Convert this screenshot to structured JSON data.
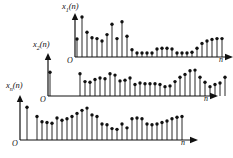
{
  "figure": {
    "background": "#ffffff",
    "ink": "#111111",
    "width": 233,
    "height": 158
  },
  "panels": [
    {
      "id": "panel-x1",
      "y_label_main": "x",
      "y_label_sub": "1",
      "y_label_tail": "(n)",
      "origin_label": "O",
      "x_label": "n",
      "geometry": {
        "ox": 75,
        "oy": 57,
        "axis_len": 150,
        "y_axis_top": 14
      },
      "stem_spacing": 5.0,
      "max_height": 40,
      "values": [
        0.45,
        1.0,
        0.62,
        0.48,
        0.46,
        0.4,
        0.56,
        0.82,
        0.46,
        0.88,
        0.52,
        0.18,
        0.1,
        0.1,
        0.1,
        0.1,
        0.2,
        0.22,
        0.22,
        0.2,
        0.1,
        0.1,
        0.1,
        0.12,
        0.22,
        0.34,
        0.4,
        0.44,
        0.46,
        0.46
      ]
    },
    {
      "id": "panel-x2",
      "y_label_main": "x",
      "y_label_sub": "2",
      "y_label_tail": "(n)",
      "origin_label": "O",
      "x_label": "n",
      "geometry": {
        "ox": 48,
        "oy": 96,
        "axis_len": 162,
        "y_axis_top": 54
      },
      "stem_spacing": 5.0,
      "max_height": 36,
      "values": [
        0.62,
        0.0,
        0.0,
        0.0,
        0.0,
        0.0,
        0.0,
        0.0,
        0.0,
        0.0,
        0.0,
        0.0,
        0.0,
        0.0,
        0.0,
        0.0,
        0.0,
        0.0,
        0.0,
        0.0,
        0.0,
        0.0,
        0.0,
        0.0,
        0.0,
        0.0,
        0.0,
        0.0,
        0.0,
        0.0
      ],
      "stems": [
        {
          "x": 0,
          "v": 0.66
        },
        {
          "x": 6,
          "v": 0.62
        },
        {
          "x": 7,
          "v": 0.4
        },
        {
          "x": 8,
          "v": 0.38
        },
        {
          "x": 9,
          "v": 0.46
        },
        {
          "x": 10,
          "v": 0.5
        },
        {
          "x": 11,
          "v": 0.48
        },
        {
          "x": 12,
          "v": 0.62
        },
        {
          "x": 13,
          "v": 0.58
        },
        {
          "x": 14,
          "v": 0.42
        },
        {
          "x": 15,
          "v": 0.44
        },
        {
          "x": 16,
          "v": 0.5
        },
        {
          "x": 17,
          "v": 0.32
        },
        {
          "x": 18,
          "v": 0.36
        },
        {
          "x": 19,
          "v": 0.34
        },
        {
          "x": 20,
          "v": 0.34
        },
        {
          "x": 21,
          "v": 0.34
        },
        {
          "x": 22,
          "v": 0.32
        },
        {
          "x": 23,
          "v": 0.26
        },
        {
          "x": 24,
          "v": 0.28
        },
        {
          "x": 25,
          "v": 0.4
        },
        {
          "x": 26,
          "v": 0.52
        },
        {
          "x": 27,
          "v": 0.6
        },
        {
          "x": 28,
          "v": 0.7
        },
        {
          "x": 29,
          "v": 0.72
        },
        {
          "x": 30,
          "v": 0.52
        },
        {
          "x": 31,
          "v": 0.38
        },
        {
          "x": 32,
          "v": 0.26
        },
        {
          "x": 33,
          "v": 0.32
        },
        {
          "x": 34,
          "v": 0.36
        },
        {
          "x": 35,
          "v": 0.52
        }
      ]
    },
    {
      "id": "panel-xn",
      "y_label_main": "x",
      "y_label_sub": "n",
      "y_label_tail": "(n)",
      "origin_label": "O",
      "x_label": "n",
      "geometry": {
        "ox": 20,
        "oy": 140,
        "axis_len": 170,
        "y_axis_top": 96
      },
      "stem_spacing": 5.0,
      "max_height": 38,
      "stems": [
        {
          "x": 1,
          "v": 0.86
        },
        {
          "x": 2,
          "v": 0.0
        },
        {
          "x": 3,
          "v": 0.62
        },
        {
          "x": 4,
          "v": 0.48
        },
        {
          "x": 5,
          "v": 0.46
        },
        {
          "x": 6,
          "v": 0.44
        },
        {
          "x": 7,
          "v": 0.58
        },
        {
          "x": 8,
          "v": 0.52
        },
        {
          "x": 9,
          "v": 0.56
        },
        {
          "x": 10,
          "v": 0.62
        },
        {
          "x": 11,
          "v": 0.7
        },
        {
          "x": 12,
          "v": 0.78
        },
        {
          "x": 13,
          "v": 0.84
        },
        {
          "x": 14,
          "v": 0.66
        },
        {
          "x": 15,
          "v": 0.62
        },
        {
          "x": 16,
          "v": 0.42
        },
        {
          "x": 17,
          "v": 0.4
        },
        {
          "x": 18,
          "v": 0.3
        },
        {
          "x": 19,
          "v": 0.28
        },
        {
          "x": 20,
          "v": 0.42
        },
        {
          "x": 21,
          "v": 0.32
        },
        {
          "x": 22,
          "v": 0.56
        },
        {
          "x": 23,
          "v": 0.58
        },
        {
          "x": 24,
          "v": 0.56
        },
        {
          "x": 25,
          "v": 0.42
        },
        {
          "x": 26,
          "v": 0.4
        },
        {
          "x": 27,
          "v": 0.42
        },
        {
          "x": 28,
          "v": 0.46
        },
        {
          "x": 29,
          "v": 0.5
        },
        {
          "x": 30,
          "v": 0.56
        },
        {
          "x": 31,
          "v": 0.6
        },
        {
          "x": 32,
          "v": 0.62
        }
      ]
    }
  ],
  "chart_data": {
    "type": "scatter",
    "xlabel": "n",
    "ylabel": "x(n)",
    "grid": false,
    "legend": null,
    "series": [
      {
        "name": "x1(n)",
        "values": [
          0.45,
          1.0,
          0.62,
          0.48,
          0.46,
          0.4,
          0.56,
          0.82,
          0.46,
          0.88,
          0.52,
          0.18,
          0.1,
          0.1,
          0.1,
          0.1,
          0.2,
          0.22,
          0.22,
          0.2,
          0.1,
          0.1,
          0.1,
          0.12,
          0.22,
          0.34,
          0.4,
          0.44,
          0.46,
          0.46
        ]
      },
      {
        "name": "x2(n)",
        "values": [
          0.66,
          0.62,
          0.4,
          0.38,
          0.46,
          0.5,
          0.48,
          0.62,
          0.58,
          0.42,
          0.44,
          0.5,
          0.32,
          0.36,
          0.34,
          0.34,
          0.34,
          0.32,
          0.26,
          0.28,
          0.4,
          0.52,
          0.6,
          0.7,
          0.72,
          0.52,
          0.38,
          0.26,
          0.32,
          0.36,
          0.52
        ]
      },
      {
        "name": "xn(n)",
        "values": [
          0.86,
          0.62,
          0.48,
          0.46,
          0.44,
          0.58,
          0.52,
          0.56,
          0.62,
          0.7,
          0.78,
          0.84,
          0.66,
          0.62,
          0.42,
          0.4,
          0.3,
          0.28,
          0.42,
          0.32,
          0.56,
          0.58,
          0.56,
          0.42,
          0.4,
          0.42,
          0.46,
          0.5,
          0.56,
          0.6,
          0.62
        ]
      }
    ]
  }
}
